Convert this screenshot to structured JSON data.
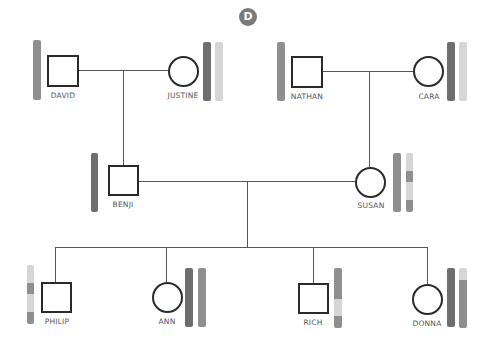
{
  "panel_label": "D",
  "colors": {
    "dark": "#6e6e6e",
    "medium": "#8f8f8f",
    "light": "#d6d6d6",
    "line": "#555555",
    "symbol_border": "#2a2a2a"
  },
  "individuals": [
    {
      "name": "DAVID",
      "sex": "male",
      "generation": 1,
      "bars": [
        [
          {
            "c": "medium",
            "h": 1
          }
        ]
      ]
    },
    {
      "name": "JUSTINE",
      "sex": "female",
      "generation": 1,
      "bars": [
        [
          {
            "c": "dark",
            "h": 1
          }
        ],
        [
          {
            "c": "light",
            "h": 1
          }
        ]
      ]
    },
    {
      "name": "NATHAN",
      "sex": "male",
      "generation": 1,
      "bars": [
        [
          {
            "c": "medium",
            "h": 1
          }
        ]
      ]
    },
    {
      "name": "CARA",
      "sex": "female",
      "generation": 1,
      "bars": [
        [
          {
            "c": "dark",
            "h": 1
          }
        ],
        [
          {
            "c": "light",
            "h": 1
          }
        ]
      ]
    },
    {
      "name": "BENJI",
      "sex": "male",
      "generation": 2,
      "bars": [
        [
          {
            "c": "dark",
            "h": 1
          }
        ]
      ]
    },
    {
      "name": "SUSAN",
      "sex": "female",
      "generation": 2,
      "bars": [
        [
          {
            "c": "medium",
            "h": 1
          }
        ],
        [
          {
            "c": "light",
            "h": 0.3
          },
          {
            "c": "medium",
            "h": 0.2
          },
          {
            "c": "light",
            "h": 0.3
          },
          {
            "c": "medium",
            "h": 0.2
          }
        ]
      ]
    },
    {
      "name": "PHILIP",
      "sex": "male",
      "generation": 3,
      "bars": [
        [
          {
            "c": "light",
            "h": 0.3
          },
          {
            "c": "medium",
            "h": 0.2
          },
          {
            "c": "light",
            "h": 0.3
          },
          {
            "c": "medium",
            "h": 0.2
          }
        ]
      ]
    },
    {
      "name": "ANN",
      "sex": "female",
      "generation": 3,
      "bars": [
        [
          {
            "c": "dark",
            "h": 1
          }
        ],
        [
          {
            "c": "medium",
            "h": 1
          }
        ]
      ]
    },
    {
      "name": "RICH",
      "sex": "male",
      "generation": 3,
      "bars": [
        [
          {
            "c": "medium",
            "h": 0.5
          },
          {
            "c": "light",
            "h": 0.3
          },
          {
            "c": "medium",
            "h": 0.2
          }
        ]
      ]
    },
    {
      "name": "DONNA",
      "sex": "female",
      "generation": 3,
      "bars": [
        [
          {
            "c": "dark",
            "h": 1
          }
        ],
        [
          {
            "c": "light",
            "h": 0.2
          },
          {
            "c": "medium",
            "h": 0.8
          }
        ]
      ]
    }
  ],
  "relationships": [
    {
      "type": "couple",
      "members": [
        "DAVID",
        "JUSTINE"
      ],
      "child": "BENJI"
    },
    {
      "type": "couple",
      "members": [
        "NATHAN",
        "CARA"
      ],
      "child": "SUSAN"
    },
    {
      "type": "couple",
      "members": [
        "BENJI",
        "SUSAN"
      ],
      "children": [
        "PHILIP",
        "ANN",
        "RICH",
        "DONNA"
      ]
    }
  ]
}
